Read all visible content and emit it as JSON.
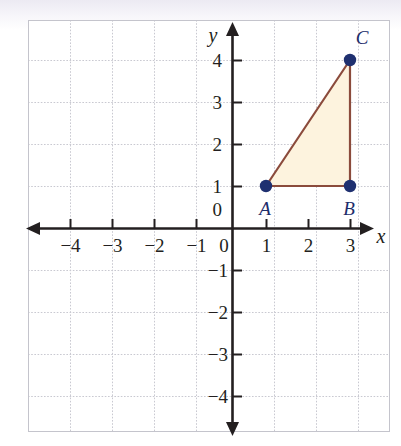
{
  "figure": {
    "axis_labels": {
      "x": "x",
      "y": "y"
    },
    "origin_label": "0",
    "origin_label_y_axis": "0",
    "x_ticks": [
      {
        "value": -4,
        "label": "−4"
      },
      {
        "value": -3,
        "label": "−3"
      },
      {
        "value": -2,
        "label": "−2"
      },
      {
        "value": -1,
        "label": "−1"
      },
      {
        "value": 1,
        "label": "1"
      },
      {
        "value": 2,
        "label": "2"
      },
      {
        "value": 3,
        "label": "3"
      }
    ],
    "y_ticks": [
      {
        "value": 4,
        "label": "4"
      },
      {
        "value": 3,
        "label": "3"
      },
      {
        "value": 2,
        "label": "2"
      },
      {
        "value": 1,
        "label": "1"
      },
      {
        "value": -1,
        "label": "−1"
      },
      {
        "value": -2,
        "label": "−2"
      },
      {
        "value": -3,
        "label": "−3"
      },
      {
        "value": -4,
        "label": "−4"
      }
    ],
    "points": [
      {
        "name": "A",
        "label": "A",
        "x": 1,
        "y": 1
      },
      {
        "name": "B",
        "label": "B",
        "x": 3,
        "y": 1
      },
      {
        "name": "C",
        "label": "C",
        "x": 3,
        "y": 4
      }
    ],
    "colors": {
      "grid": "#c9c9d1",
      "axis": "#231f20",
      "point": "#1f3070",
      "triangle_stroke": "#8b4b3c",
      "triangle_fill": "#fdf3de",
      "label": "#1d2d6b",
      "frame": "#c4c4cc"
    }
  }
}
